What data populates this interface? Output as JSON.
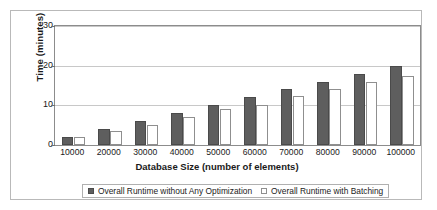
{
  "chart_data": {
    "type": "bar",
    "title": "",
    "xlabel": "Database Size (number of elements)",
    "ylabel": "Time (minutes)",
    "categories": [
      "10000",
      "20000",
      "30000",
      "40000",
      "50000",
      "60000",
      "70000",
      "80000",
      "90000",
      "100000"
    ],
    "series": [
      {
        "name": "Overall Runtime without Any Optimization",
        "color": "#5e5e5e",
        "values": [
          2,
          4,
          6,
          8,
          10,
          12,
          14,
          16,
          18,
          20
        ]
      },
      {
        "name": "Overall Runtime with Batching",
        "color": "#ffffff",
        "values": [
          2,
          3.5,
          5,
          7,
          9,
          10,
          12.3,
          14,
          15.8,
          17.5
        ]
      }
    ],
    "ylim": [
      0,
      30
    ],
    "yticks": [
      0,
      10,
      20,
      30
    ],
    "ytick_labels": [
      "0",
      "10",
      "20",
      "30"
    ],
    "grid": true,
    "legend_position": "bottom"
  },
  "legend": {
    "entries": [
      {
        "label": "Overall Runtime without Any Optimization",
        "swatch": "filled-dark-swatch"
      },
      {
        "label": "Overall Runtime with Batching",
        "swatch": "outline-light-swatch"
      }
    ]
  },
  "colors": {
    "series_dark": "#5e5e5e",
    "series_light": "#ffffff",
    "gridline": "#c8c8c8",
    "axis": "#8c8c8c",
    "frame": "#b9b9b9",
    "text": "#1a1a1a"
  }
}
